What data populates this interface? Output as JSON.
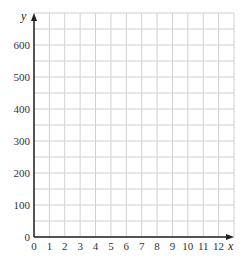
{
  "chart_data": {
    "type": "scatter",
    "title": "",
    "xlabel": "x",
    "ylabel": "y",
    "xlim": [
      0,
      13
    ],
    "ylim": [
      0,
      700
    ],
    "x_ticks": [
      0,
      1,
      2,
      3,
      4,
      5,
      6,
      7,
      8,
      9,
      10,
      11,
      12
    ],
    "y_ticks": [
      0,
      100,
      200,
      300,
      400,
      500,
      600
    ],
    "x_grid_step": 1,
    "y_grid_step": 50,
    "grid": true,
    "series": [],
    "legend": null
  },
  "colors": {
    "grid": "#d0d0d0",
    "axis": "#222222",
    "text": "#333333"
  }
}
